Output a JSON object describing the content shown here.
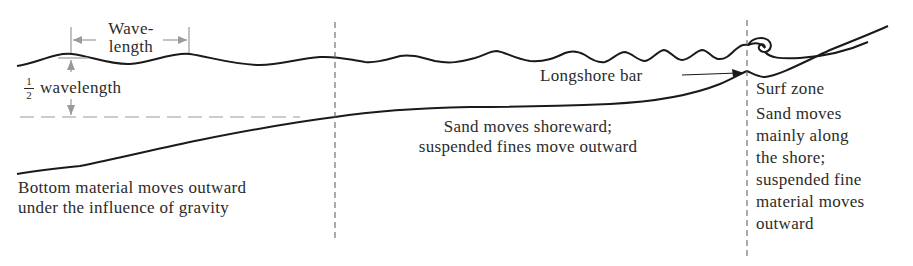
{
  "diagram": {
    "labels": {
      "wavelength_line1": "Wave-",
      "wavelength_line2": "length",
      "half_numerator": "1",
      "half_denominator": "2",
      "half_wavelength": "wavelength",
      "longshore_bar": "Longshore bar",
      "surf_zone": "Surf zone",
      "offshore_zone": [
        "Bottom material moves outward",
        "under the influence of gravity"
      ],
      "middle_zone": [
        "Sand moves shoreward;",
        "suspended fines move outward"
      ],
      "surf_zone_text": [
        "Sand moves",
        "mainly along",
        "the shore;",
        "suspended fine",
        "material moves",
        "outward"
      ]
    },
    "colors": {
      "line": "#1a1a1a",
      "dimension": "#9a9a9a",
      "text": "#2b2b2b",
      "background": "#ffffff"
    }
  }
}
